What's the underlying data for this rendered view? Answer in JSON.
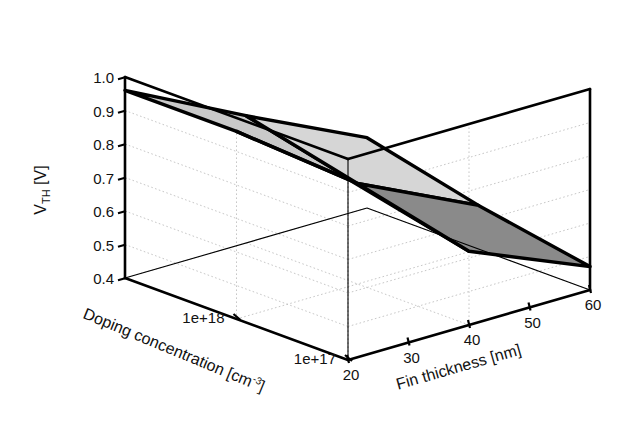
{
  "chart_data": {
    "type": "surface",
    "title": "",
    "xlabel": "Doping concentration [cm",
    "xlabel_sup": "-3",
    "xlabel_close": "]",
    "ylabel": "Fin thickness [nm]",
    "zlabel_main": "V",
    "zlabel_sub": "TH",
    "zlabel_unit": " [V]",
    "x_name": "doping_concentration",
    "y_name": "fin_thickness",
    "z_name": "V_TH",
    "x_ticks": [
      "1e+18",
      "1e+17"
    ],
    "x_tick_values": [
      1e+18,
      1e+17
    ],
    "y_ticks": [
      "20",
      "30",
      "40",
      "50",
      "60"
    ],
    "y_tick_values": [
      20,
      30,
      40,
      50,
      60
    ],
    "z_ticks": [
      "1.0",
      "0.9",
      "0.8",
      "0.7",
      "0.6",
      "0.5",
      "0.4"
    ],
    "z_tick_values": [
      1.0,
      0.9,
      0.8,
      0.7,
      0.6,
      0.5,
      0.4
    ],
    "zlim": [
      0.4,
      1.0
    ],
    "grid": true,
    "legend": "none",
    "x_grid_values": [
      1e+19,
      1e+18,
      1e+17
    ],
    "y_grid_values": [
      20,
      40,
      60
    ],
    "surface_x": [
      1e+19,
      1e+18,
      1e+17
    ],
    "surface_y": [
      20,
      40,
      60
    ],
    "surface_z": [
      [
        0.96,
        0.78,
        0.61
      ],
      [
        0.96,
        0.7,
        0.53
      ],
      [
        0.94,
        0.62,
        0.47
      ]
    ],
    "surface_shades": [
      [
        "#c9c9c9",
        "#d6d6d6"
      ],
      [
        "#b0b0b0",
        "#8a8a8a"
      ],
      [
        "#9a9a9a",
        "#6b6b6b"
      ]
    ],
    "edge_color": "#000000",
    "axis_color": "#000000",
    "grid_color": "#b9b9b9",
    "background": "#ffffff"
  }
}
